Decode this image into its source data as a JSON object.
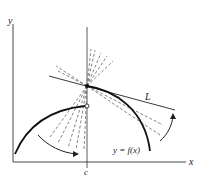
{
  "figure": {
    "axis_labels": {
      "x": "x",
      "y": "y"
    },
    "point_label": "c",
    "line_label": "L",
    "function_label": "y = f(x)"
  },
  "colors": {
    "ink": "#1a1a1a",
    "dashed": "#666666",
    "axis": "#333333",
    "background": "#ffffff"
  }
}
